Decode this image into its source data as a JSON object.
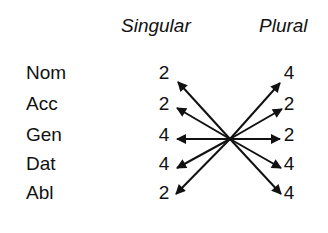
{
  "columns": {
    "singular": "Singular",
    "plural": "Plural"
  },
  "rows": [
    {
      "case": "Nom",
      "singular": "2",
      "plural": "4"
    },
    {
      "case": "Acc",
      "singular": "2",
      "plural": "2"
    },
    {
      "case": "Gen",
      "singular": "4",
      "plural": "2"
    },
    {
      "case": "Dat",
      "singular": "4",
      "plural": "4"
    },
    {
      "case": "Abl",
      "singular": "2",
      "plural": "4"
    }
  ],
  "colors": {
    "ink": "#111111",
    "background": "#ffffff"
  }
}
